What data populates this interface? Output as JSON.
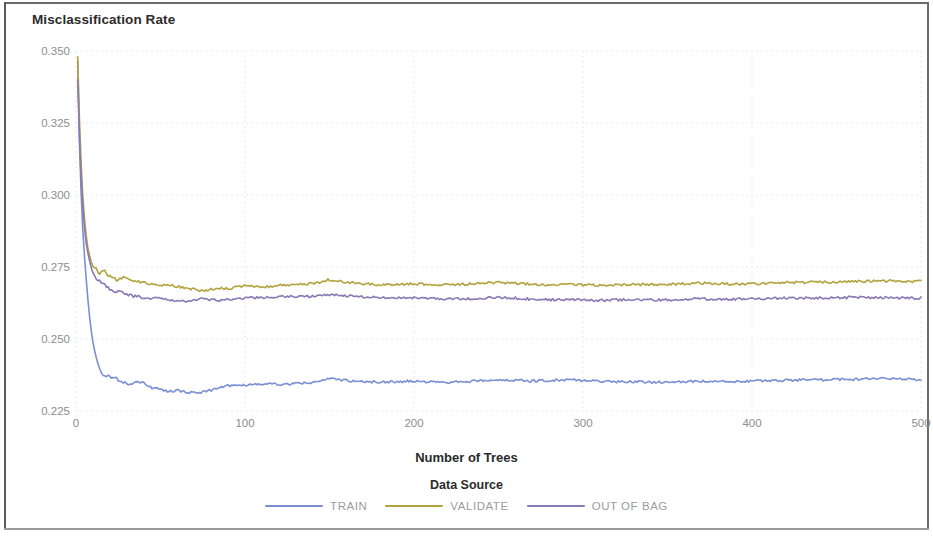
{
  "chart_data": {
    "type": "line",
    "title": "Misclassification Rate",
    "xlabel": "Number of Trees",
    "ylabel": "",
    "xlim": [
      0,
      500
    ],
    "ylim": [
      0.225,
      0.35
    ],
    "xticks": [
      0,
      100,
      200,
      300,
      400,
      500
    ],
    "xtick_labels": [
      "0",
      "100",
      "200",
      "300",
      "400",
      "500"
    ],
    "yticks": [
      0.225,
      0.25,
      0.275,
      0.3,
      0.325,
      0.35
    ],
    "ytick_labels": [
      "0.225",
      "0.250",
      "0.275",
      "0.300",
      "0.325",
      "0.350"
    ],
    "grid": true,
    "grid_style": "dotted",
    "legend_title": "Data Source",
    "legend_position": "bottom",
    "colors": {
      "train": "#7b8fd4",
      "validate": "#b3a33f",
      "out_of_bag": "#8a78b8",
      "grid": "#e9e9ef",
      "tick_text": "#8d8d8d",
      "title_text": "#2b2b2b",
      "frame": "#6b6b6b"
    },
    "series": [
      {
        "name": "TRAIN",
        "color": "#7b8fd4",
        "x": [
          1,
          2,
          3,
          4,
          5,
          6,
          7,
          8,
          9,
          10,
          12,
          14,
          16,
          18,
          20,
          24,
          28,
          32,
          36,
          40,
          45,
          50,
          55,
          60,
          65,
          70,
          75,
          80,
          85,
          90,
          95,
          100,
          110,
          120,
          130,
          140,
          150,
          160,
          170,
          180,
          190,
          200,
          210,
          220,
          230,
          240,
          250,
          260,
          270,
          280,
          290,
          300,
          310,
          320,
          330,
          340,
          350,
          360,
          370,
          380,
          390,
          400,
          410,
          420,
          430,
          440,
          450,
          460,
          470,
          480,
          490,
          500
        ],
        "y": [
          0.3465,
          0.319,
          0.301,
          0.288,
          0.279,
          0.271,
          0.264,
          0.258,
          0.253,
          0.249,
          0.243,
          0.2395,
          0.2378,
          0.2372,
          0.2368,
          0.2362,
          0.235,
          0.2345,
          0.2352,
          0.2348,
          0.233,
          0.2326,
          0.2318,
          0.2322,
          0.2316,
          0.2312,
          0.2316,
          0.2322,
          0.233,
          0.2338,
          0.2336,
          0.234,
          0.2344,
          0.2342,
          0.2346,
          0.2348,
          0.2362,
          0.2356,
          0.2352,
          0.235,
          0.2352,
          0.2354,
          0.2352,
          0.235,
          0.2352,
          0.2356,
          0.2358,
          0.2356,
          0.2354,
          0.2356,
          0.2358,
          0.2356,
          0.2354,
          0.2352,
          0.2352,
          0.235,
          0.235,
          0.2352,
          0.2354,
          0.2352,
          0.2352,
          0.2354,
          0.2356,
          0.2356,
          0.2358,
          0.2358,
          0.236,
          0.236,
          0.2362,
          0.2362,
          0.236,
          0.236
        ]
      },
      {
        "name": "VALIDATE",
        "color": "#b3a33f",
        "x": [
          1,
          2,
          3,
          4,
          5,
          6,
          7,
          8,
          9,
          10,
          12,
          14,
          16,
          18,
          20,
          24,
          28,
          32,
          36,
          40,
          45,
          50,
          55,
          60,
          65,
          70,
          75,
          80,
          85,
          90,
          95,
          100,
          110,
          120,
          130,
          140,
          150,
          160,
          170,
          180,
          190,
          200,
          210,
          220,
          230,
          240,
          250,
          260,
          270,
          280,
          290,
          300,
          310,
          320,
          330,
          340,
          350,
          360,
          370,
          380,
          390,
          400,
          410,
          420,
          430,
          440,
          450,
          460,
          470,
          480,
          490,
          500
        ],
        "y": [
          0.348,
          0.327,
          0.3115,
          0.3,
          0.292,
          0.286,
          0.2818,
          0.279,
          0.2768,
          0.2752,
          0.2742,
          0.2728,
          0.2742,
          0.2726,
          0.2718,
          0.2704,
          0.2712,
          0.2708,
          0.27,
          0.2696,
          0.269,
          0.2684,
          0.2688,
          0.2682,
          0.2676,
          0.2672,
          0.2668,
          0.2672,
          0.2678,
          0.2674,
          0.268,
          0.2686,
          0.268,
          0.2686,
          0.269,
          0.2692,
          0.2706,
          0.2698,
          0.2692,
          0.2688,
          0.269,
          0.2692,
          0.269,
          0.2688,
          0.269,
          0.2694,
          0.2696,
          0.2694,
          0.269,
          0.2688,
          0.269,
          0.2688,
          0.2686,
          0.2688,
          0.269,
          0.2688,
          0.269,
          0.2692,
          0.2694,
          0.2692,
          0.269,
          0.2692,
          0.2694,
          0.2696,
          0.2696,
          0.2698,
          0.2698,
          0.27,
          0.27,
          0.2702,
          0.27,
          0.27
        ]
      },
      {
        "name": "OUT OF BAG",
        "color": "#8a78b8",
        "x": [
          1,
          2,
          3,
          4,
          5,
          6,
          7,
          8,
          9,
          10,
          12,
          14,
          16,
          18,
          20,
          24,
          28,
          32,
          36,
          40,
          45,
          50,
          55,
          60,
          65,
          70,
          75,
          80,
          85,
          90,
          95,
          100,
          110,
          120,
          130,
          140,
          150,
          160,
          170,
          180,
          190,
          200,
          210,
          220,
          230,
          240,
          250,
          260,
          270,
          280,
          290,
          300,
          310,
          320,
          330,
          340,
          350,
          360,
          370,
          380,
          390,
          400,
          410,
          420,
          430,
          440,
          450,
          460,
          470,
          480,
          490,
          500
        ],
        "y": [
          0.34,
          0.321,
          0.306,
          0.296,
          0.2886,
          0.2834,
          0.28,
          0.2772,
          0.2748,
          0.273,
          0.271,
          0.27,
          0.2694,
          0.2682,
          0.2674,
          0.2664,
          0.266,
          0.2652,
          0.2648,
          0.2644,
          0.264,
          0.2642,
          0.2636,
          0.2634,
          0.263,
          0.2634,
          0.264,
          0.2636,
          0.2632,
          0.2636,
          0.264,
          0.2642,
          0.2644,
          0.2648,
          0.2646,
          0.2648,
          0.2654,
          0.265,
          0.2646,
          0.2644,
          0.2642,
          0.2644,
          0.264,
          0.2638,
          0.264,
          0.2642,
          0.2644,
          0.2642,
          0.2638,
          0.2636,
          0.2638,
          0.2636,
          0.2634,
          0.2636,
          0.2638,
          0.2636,
          0.2636,
          0.2638,
          0.264,
          0.2638,
          0.2638,
          0.264,
          0.264,
          0.2642,
          0.2642,
          0.2642,
          0.2644,
          0.2644,
          0.2644,
          0.2644,
          0.2642,
          0.2642
        ]
      }
    ]
  },
  "legend": {
    "title": "Data Source",
    "items": [
      {
        "label": "TRAIN",
        "color": "#7b8fd4"
      },
      {
        "label": "VALIDATE",
        "color": "#b3a33f"
      },
      {
        "label": "OUT OF BAG",
        "color": "#8a78b8"
      }
    ]
  }
}
